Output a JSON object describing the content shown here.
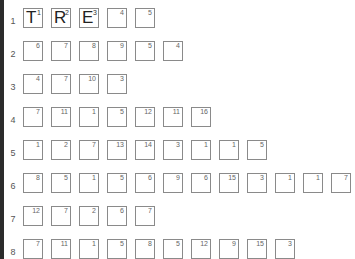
{
  "rows": [
    {
      "label": "1",
      "cells": [
        {
          "num": "1",
          "letter": "T"
        },
        {
          "num": "2",
          "letter": "R"
        },
        {
          "num": "3",
          "letter": "E"
        },
        {
          "num": "4",
          "letter": ""
        },
        {
          "num": "5",
          "letter": ""
        }
      ]
    },
    {
      "label": "2",
      "cells": [
        {
          "num": "6",
          "letter": ""
        },
        {
          "num": "7",
          "letter": ""
        },
        {
          "num": "8",
          "letter": ""
        },
        {
          "num": "9",
          "letter": ""
        },
        {
          "num": "5",
          "letter": ""
        },
        {
          "num": "4",
          "letter": ""
        }
      ]
    },
    {
      "label": "3",
      "cells": [
        {
          "num": "4",
          "letter": ""
        },
        {
          "num": "7",
          "letter": ""
        },
        {
          "num": "10",
          "letter": ""
        },
        {
          "num": "3",
          "letter": ""
        }
      ]
    },
    {
      "label": "4",
      "cells": [
        {
          "num": "7",
          "letter": ""
        },
        {
          "num": "11",
          "letter": ""
        },
        {
          "num": "1",
          "letter": ""
        },
        {
          "num": "5",
          "letter": ""
        },
        {
          "num": "12",
          "letter": ""
        },
        {
          "num": "11",
          "letter": ""
        },
        {
          "num": "16",
          "letter": ""
        }
      ]
    },
    {
      "label": "5",
      "cells": [
        {
          "num": "1",
          "letter": ""
        },
        {
          "num": "2",
          "letter": ""
        },
        {
          "num": "7",
          "letter": ""
        },
        {
          "num": "13",
          "letter": ""
        },
        {
          "num": "14",
          "letter": ""
        },
        {
          "num": "3",
          "letter": ""
        },
        {
          "num": "1",
          "letter": ""
        },
        {
          "num": "1",
          "letter": ""
        },
        {
          "num": "5",
          "letter": ""
        }
      ]
    },
    {
      "label": "6",
      "cells": [
        {
          "num": "8",
          "letter": ""
        },
        {
          "num": "5",
          "letter": ""
        },
        {
          "num": "1",
          "letter": ""
        },
        {
          "num": "5",
          "letter": ""
        },
        {
          "num": "6",
          "letter": ""
        },
        {
          "num": "9",
          "letter": ""
        },
        {
          "num": "6",
          "letter": ""
        },
        {
          "num": "15",
          "letter": ""
        },
        {
          "num": "3",
          "letter": ""
        },
        {
          "num": "1",
          "letter": ""
        },
        {
          "num": "1",
          "letter": ""
        },
        {
          "num": "7",
          "letter": ""
        }
      ]
    },
    {
      "label": "7",
      "cells": [
        {
          "num": "12",
          "letter": ""
        },
        {
          "num": "7",
          "letter": ""
        },
        {
          "num": "2",
          "letter": ""
        },
        {
          "num": "6",
          "letter": ""
        },
        {
          "num": "7",
          "letter": ""
        }
      ]
    },
    {
      "label": "8",
      "cells": [
        {
          "num": "7",
          "letter": ""
        },
        {
          "num": "11",
          "letter": ""
        },
        {
          "num": "1",
          "letter": ""
        },
        {
          "num": "5",
          "letter": ""
        },
        {
          "num": "8",
          "letter": ""
        },
        {
          "num": "5",
          "letter": ""
        },
        {
          "num": "12",
          "letter": ""
        },
        {
          "num": "9",
          "letter": ""
        },
        {
          "num": "15",
          "letter": ""
        },
        {
          "num": "3",
          "letter": ""
        }
      ]
    }
  ],
  "colors": {
    "cell_border": "#8a8a8a",
    "background": "#ffffff",
    "edge": "#2b2b2b"
  }
}
